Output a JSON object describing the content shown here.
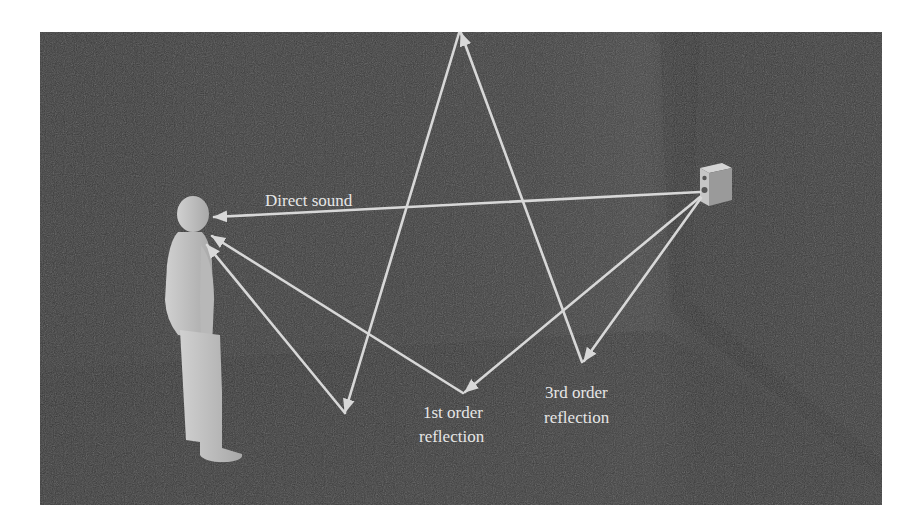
{
  "figure": {
    "labels": {
      "direct": "Direct sound",
      "first_order_line1": "1st order",
      "first_order_line2": "reflection",
      "third_order_line1": "3rd order",
      "third_order_line2": "reflection"
    },
    "colors": {
      "background": "#ffffff",
      "room": "#3c3c3c",
      "room_dark": "#2e2e2e",
      "ray": "#d8d8d8",
      "figure": "#bdbdbd",
      "speaker": "#a9a9a9",
      "text": "#e6e6e6"
    },
    "elements": [
      "listener",
      "loudspeaker",
      "direct-sound-path",
      "first-order-reflection-path",
      "third-order-reflection-path"
    ]
  }
}
